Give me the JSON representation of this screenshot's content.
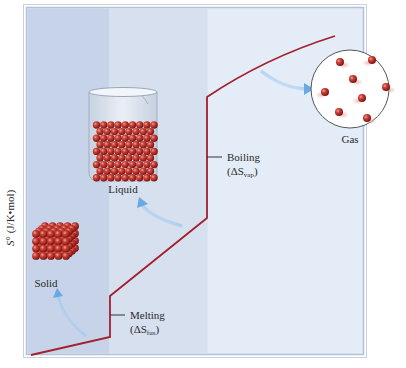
{
  "figure": {
    "y_axis_label": "S° (J/K•mol)",
    "y_axis_label_parts": {
      "symbol": "S",
      "superscript": "°",
      "units": " (J/K•mol)"
    },
    "regions": [
      {
        "name": "solid",
        "color": "#c6d3e8"
      },
      {
        "name": "liquid",
        "color": "#d5e0ef"
      },
      {
        "name": "gas",
        "color": "#e3ecf7"
      }
    ],
    "frame_color": "#b9c6da",
    "curve_color": "#a3202c",
    "arrow_color": "#7fb6e6",
    "phases": {
      "solid": {
        "label": "Solid"
      },
      "liquid": {
        "label": "Liquid"
      },
      "gas": {
        "label": "Gas"
      }
    },
    "transitions": {
      "melting": {
        "label": "Melting",
        "delta_prefix": "(ΔS",
        "subscript": "fus",
        "suffix": ")"
      },
      "boiling": {
        "label": "Boiling",
        "delta_prefix": "(ΔS",
        "subscript": "vap",
        "suffix": ")"
      }
    }
  }
}
